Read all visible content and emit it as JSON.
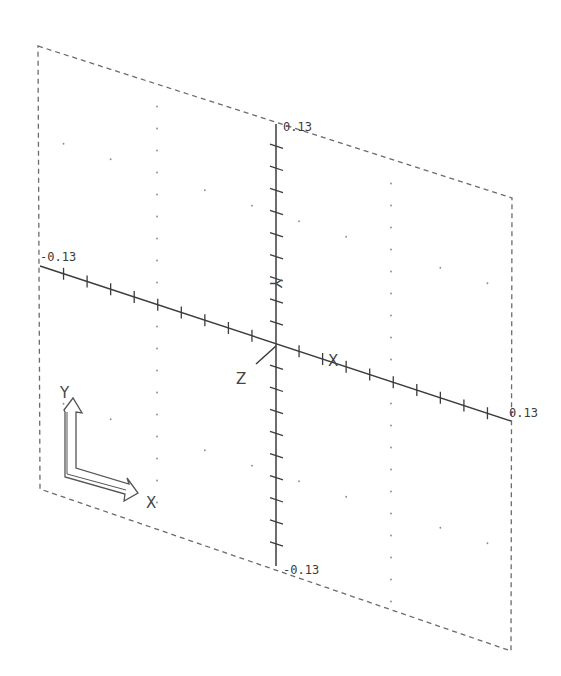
{
  "drawing": {
    "type": "isometric-coordinate-plane",
    "plane_corners": {
      "top_left": [
        38,
        46
      ],
      "top_right": [
        512,
        198
      ],
      "bottom_right": [
        511,
        651
      ],
      "bottom_left": [
        40,
        489
      ]
    },
    "origin": [
      275,
      346
    ],
    "x_axis": {
      "label": "X",
      "start": [
        40,
        266
      ],
      "end": [
        511,
        421
      ],
      "tick_count": 20,
      "min_label": "-0.13",
      "max_label": "0.13"
    },
    "y_axis": {
      "label": "Y",
      "start": [
        276,
        124
      ],
      "end": [
        276,
        566
      ],
      "tick_count": 20,
      "min_label": "-0.13",
      "max_label": "0.13"
    },
    "z_axis": {
      "label": "Z"
    },
    "ucs_icon": {
      "x_label": "X",
      "y_label": "Y"
    },
    "colors": {
      "background": "#ffffff",
      "lines": "#3c3c3c",
      "dashed_border": "#6b6b6b",
      "grid_dots": "#8a8a8a"
    }
  }
}
